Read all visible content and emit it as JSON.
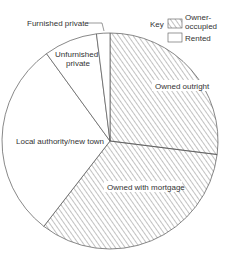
{
  "chart_data": {
    "type": "pie",
    "title": "",
    "slices": [
      {
        "label": "Owned outright",
        "value": 27,
        "category": "Owner-occupied"
      },
      {
        "label": "Owned with mortgage",
        "value": 33.5,
        "category": "Owner-occupied"
      },
      {
        "label": "Local authority/new town",
        "value": 29.5,
        "category": "Rented"
      },
      {
        "label": "Unfurnished private",
        "value": 8,
        "category": "Rented"
      },
      {
        "label": "Furnished private",
        "value": 2,
        "category": "Rented"
      }
    ],
    "start_angle_deg": 0,
    "direction": "clockwise",
    "legend": {
      "title": "Key",
      "position": "top-right",
      "entries": [
        {
          "label": "Owner-occupied",
          "pattern": "hatched"
        },
        {
          "label": "Rented",
          "pattern": "blank"
        }
      ]
    }
  },
  "labels": {
    "owned_outright": "Owned outright",
    "owned_mortgage": "Owned with mortgage",
    "local_authority": "Local authority/new town",
    "unfurnished_1": "Unfurnished",
    "unfurnished_2": "private",
    "furnished": "Furnished private",
    "key": "Key",
    "owner_1": "Owner-",
    "owner_2": "occupied",
    "rented": "Rented"
  },
  "colors": {
    "stroke": "#555555",
    "hatch": "#777777",
    "background": "#ffffff"
  }
}
